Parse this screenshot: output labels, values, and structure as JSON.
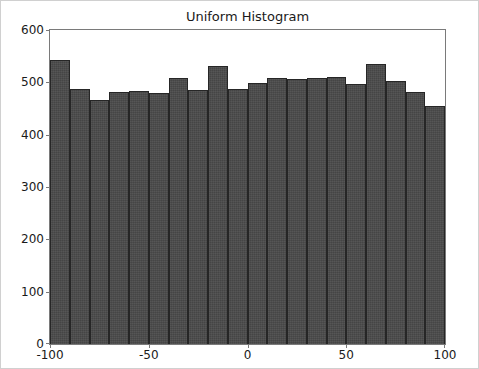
{
  "chart_data": {
    "type": "bar",
    "title": "Uniform Histogram",
    "xlabel": "",
    "ylabel": "",
    "xlim": [
      -100,
      100
    ],
    "ylim": [
      0,
      600
    ],
    "grid": false,
    "legend": null,
    "bin_width": 10,
    "bin_edges": [
      -100,
      -90,
      -80,
      -70,
      -60,
      -50,
      -40,
      -30,
      -20,
      -10,
      0,
      10,
      20,
      30,
      40,
      50,
      60,
      70,
      80,
      90,
      100
    ],
    "bin_centers": [
      -95,
      -85,
      -75,
      -65,
      -55,
      -45,
      -35,
      -25,
      -15,
      -5,
      5,
      15,
      25,
      35,
      45,
      55,
      65,
      75,
      85,
      95
    ],
    "categories": [
      "-100 to -90",
      "-90 to -80",
      "-80 to -70",
      "-70 to -60",
      "-60 to -50",
      "-50 to -40",
      "-40 to -30",
      "-30 to -20",
      "-20 to -10",
      "-10 to 0",
      "0 to 10",
      "10 to 20",
      "20 to 30",
      "30 to 40",
      "40 to 50",
      "50 to 60",
      "60 to 70",
      "70 to 80",
      "80 to 90",
      "90 to 100"
    ],
    "values": [
      543,
      488,
      466,
      481,
      483,
      479,
      508,
      485,
      531,
      487,
      498,
      508,
      506,
      508,
      510,
      497,
      535,
      503,
      482,
      454
    ],
    "xticks": [
      -100,
      -50,
      0,
      50,
      100
    ],
    "xtick_labels": [
      "-100",
      "-50",
      "0",
      "50",
      "100"
    ],
    "yticks": [
      0,
      100,
      200,
      300,
      400,
      500,
      600
    ],
    "ytick_labels": [
      "0",
      "100",
      "200",
      "300",
      "400",
      "500",
      "600"
    ],
    "bar_color": "#4a4a4a",
    "bar_edge_color": "#262626",
    "axes_color": "#7a7a7a",
    "background_color": "#ffffff",
    "text_color": "#1a1a1a"
  }
}
